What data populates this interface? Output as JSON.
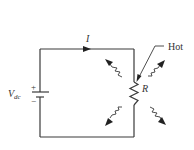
{
  "diagram": {
    "type": "circuit",
    "labels": {
      "current": "I",
      "source_main": "V",
      "source_sub": "dc",
      "plus": "+",
      "minus": "−",
      "resistor": "R",
      "hot": "Hot"
    },
    "components": [
      {
        "name": "dc-voltage-source",
        "label": "Vdc"
      },
      {
        "name": "resistor",
        "label": "R"
      }
    ],
    "annotations": [
      {
        "text": "Hot",
        "points_to": "resistor"
      },
      {
        "text": "I",
        "meaning": "current direction arrow on top wire, pointing right"
      },
      {
        "text": "heat radiation",
        "count": 4,
        "directions": [
          "up-left",
          "up-right",
          "down-left",
          "down-right"
        ]
      }
    ],
    "colors": {
      "line": "#3a3a3a",
      "text": "#333333",
      "background": "#ffffff"
    }
  }
}
